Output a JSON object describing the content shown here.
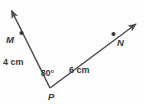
{
  "figure": {
    "type": "angle-diagram",
    "background_color": "#fdfdfd",
    "stroke_color": "#4a4a4a",
    "text_color": "#3a3a3a"
  },
  "labels": {
    "point_m": "M",
    "point_n": "N",
    "point_p": "P",
    "length_left": "4 cm",
    "length_right": "6 cm",
    "angle": "80°"
  },
  "geometry": {
    "vertex_p": {
      "x": 50,
      "y": 88
    },
    "point_m": {
      "x": 21,
      "y": 33
    },
    "point_n": {
      "x": 114,
      "y": 34
    },
    "ray_left_tip": {
      "x": 10,
      "y": 8
    },
    "ray_right_tip": {
      "x": 138,
      "y": 22
    },
    "angle_degrees": 80,
    "segment_pm_length": "4 cm",
    "segment_pn_length": "6 cm"
  }
}
